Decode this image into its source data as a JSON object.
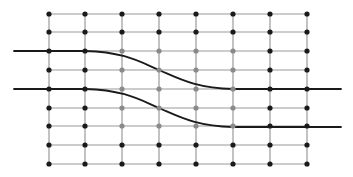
{
  "diagram": {
    "grid": {
      "columns_x": [
        49,
        85,
        122,
        159,
        196,
        233,
        270,
        307
      ],
      "rows_y": [
        14,
        32,
        51,
        70,
        89,
        108,
        126,
        145,
        164
      ],
      "line_color": "#9a9a9a",
      "line_width": 1.2
    },
    "nodes": {
      "radius": 2.6,
      "default_color": "#1a1a1a",
      "highlight_color": "#8a8a8a",
      "highlight_columns": [
        2,
        3,
        4,
        5
      ],
      "highlight_rows": [
        2,
        3,
        4,
        5,
        6
      ]
    },
    "curves": [
      {
        "name": "upper-curve",
        "path": "M14,51 L85,51 C125,52 140,62 159,70 C178,78 195,88 233,89 L341,89",
        "color": "#1a1a1a",
        "width": 1.8
      },
      {
        "name": "lower-curve",
        "path": "M14,89 L85,89 C125,90 140,100 159,108 C178,116 195,126 233,127 L341,127",
        "color": "#1a1a1a",
        "width": 1.8
      }
    ]
  }
}
